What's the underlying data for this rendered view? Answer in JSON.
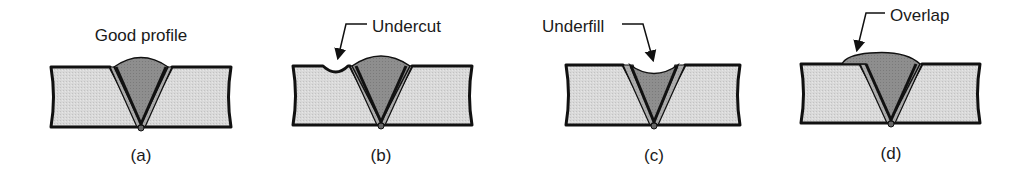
{
  "figure": {
    "panels": [
      {
        "id": "a",
        "caption": "(a)",
        "label": "Good profile",
        "defect": "none"
      },
      {
        "id": "b",
        "caption": "(b)",
        "label": "Undercut",
        "defect": "undercut"
      },
      {
        "id": "c",
        "caption": "(c)",
        "label": "Underfill",
        "defect": "underfill"
      },
      {
        "id": "d",
        "caption": "(d)",
        "label": "Overlap",
        "defect": "overlap"
      }
    ],
    "colors": {
      "plate_fill": "#d6d6d6",
      "haz_fill": "#a8a8a8",
      "weld_fill": "#8f8f8f",
      "outline": "#111111"
    }
  }
}
